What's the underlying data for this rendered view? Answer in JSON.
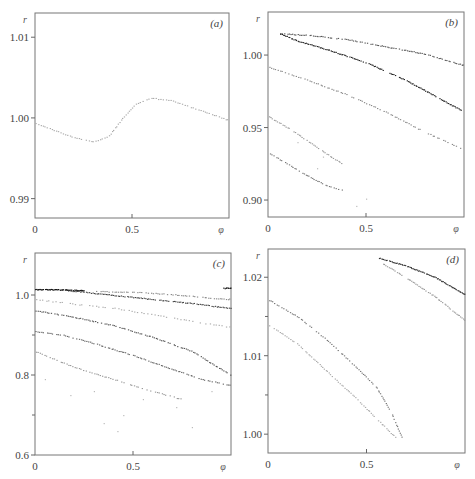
{
  "chart_data": [
    {
      "type": "scatter",
      "panel_label": "(a)",
      "xlabel": "φ",
      "ylabel": "r",
      "xlim": [
        0,
        1.0
      ],
      "ylim": [
        0.9876,
        1.013
      ],
      "xticks": [
        {
          "v": 0,
          "label": "0"
        },
        {
          "v": 0.5,
          "label": "0.5"
        }
      ],
      "yticks": [
        {
          "v": 1.01,
          "label": "1.01"
        },
        {
          "v": 1.0,
          "label": "1.00"
        },
        {
          "v": 0.99,
          "label": "0.99"
        }
      ],
      "yminor": [],
      "grid": false,
      "series": [
        {
          "name": "orbit-1",
          "shade": "#aaaaaa",
          "density": 90,
          "points": [
            [
              0.0,
              0.9994
            ],
            [
              0.1,
              0.9985
            ],
            [
              0.2,
              0.9976
            ],
            [
              0.3,
              0.9971
            ],
            [
              0.38,
              0.9978
            ],
            [
              0.45,
              1.0
            ],
            [
              0.52,
              1.0018
            ],
            [
              0.6,
              1.0025
            ],
            [
              0.7,
              1.0022
            ],
            [
              0.8,
              1.0014
            ],
            [
              0.9,
              1.0006
            ],
            [
              1.0,
              0.9997
            ]
          ]
        }
      ]
    },
    {
      "type": "scatter",
      "panel_label": "(b)",
      "xlabel": "φ",
      "ylabel": "r",
      "xlim": [
        0,
        1.0
      ],
      "ylim": [
        0.8883,
        1.0297
      ],
      "xticks": [
        {
          "v": 0,
          "label": "0"
        },
        {
          "v": 0.5,
          "label": "0.5"
        }
      ],
      "yticks": [
        {
          "v": 1.0,
          "label": "1.00"
        },
        {
          "v": 0.95,
          "label": "0.95"
        },
        {
          "v": 0.9,
          "label": "0.90"
        }
      ],
      "yminor": [],
      "grid": false,
      "series": [
        {
          "name": "upper-branch",
          "shade": "#555555",
          "density": 110,
          "points": [
            [
              0.06,
              1.015
            ],
            [
              0.2,
              1.014
            ],
            [
              0.4,
              1.011
            ],
            [
              0.6,
              1.006
            ],
            [
              0.8,
              1.001
            ],
            [
              1.0,
              0.993
            ]
          ]
        },
        {
          "name": "lower-branch",
          "shade": "#222222",
          "density": 140,
          "points": [
            [
              0.06,
              1.015
            ],
            [
              0.15,
              1.01
            ],
            [
              0.3,
              1.004
            ],
            [
              0.5,
              0.995
            ],
            [
              0.7,
              0.983
            ],
            [
              0.85,
              0.972
            ],
            [
              1.0,
              0.961
            ]
          ]
        },
        {
          "name": "middle-band",
          "shade": "#888888",
          "density": 90,
          "points": [
            [
              0.0,
              0.992
            ],
            [
              0.2,
              0.983
            ],
            [
              0.4,
              0.973
            ],
            [
              0.6,
              0.961
            ],
            [
              0.8,
              0.947
            ],
            [
              1.0,
              0.935
            ]
          ]
        },
        {
          "name": "low-band-1",
          "shade": "#999999",
          "density": 45,
          "points": [
            [
              0.0,
              0.958
            ],
            [
              0.1,
              0.95
            ],
            [
              0.2,
              0.941
            ],
            [
              0.3,
              0.932
            ],
            [
              0.38,
              0.925
            ]
          ]
        },
        {
          "name": "low-band-2",
          "shade": "#777777",
          "density": 45,
          "points": [
            [
              0.0,
              0.933
            ],
            [
              0.1,
              0.925
            ],
            [
              0.2,
              0.917
            ],
            [
              0.3,
              0.91
            ],
            [
              0.38,
              0.907
            ]
          ]
        },
        {
          "name": "scattered",
          "shade": "#bbbbbb",
          "density": 12,
          "points": [
            [
              0.15,
              0.94
            ],
            [
              0.25,
              0.922
            ],
            [
              0.45,
              0.896
            ],
            [
              0.5,
              0.901
            ],
            [
              0.28,
              0.93
            ]
          ]
        }
      ]
    },
    {
      "type": "scatter",
      "panel_label": "(c)",
      "xlabel": "φ",
      "ylabel": "r",
      "xlim": [
        0,
        1.0
      ],
      "ylim": [
        0.6,
        1.105
      ],
      "xticks": [
        {
          "v": 0,
          "label": "0"
        },
        {
          "v": 0.5,
          "label": "0.5"
        }
      ],
      "yticks": [
        {
          "v": 1.0,
          "label": "1.0"
        },
        {
          "v": 0.8,
          "label": "0.8"
        },
        {
          "v": 0.6,
          "label": "0.6"
        }
      ],
      "yminor": [
        0.9,
        0.7
      ],
      "grid": false,
      "series": [
        {
          "name": "top-solid",
          "shade": "#111111",
          "density": 60,
          "points": [
            [
              0.0,
              1.015
            ],
            [
              0.15,
              1.014
            ],
            [
              0.25,
              1.012
            ]
          ]
        },
        {
          "name": "top-right-solid",
          "shade": "#111111",
          "density": 8,
          "points": [
            [
              0.96,
              1.018
            ],
            [
              1.0,
              1.018
            ]
          ]
        },
        {
          "name": "band-1",
          "shade": "#444444",
          "density": 110,
          "points": [
            [
              0.15,
              1.013
            ],
            [
              0.4,
              1.0
            ],
            [
              0.6,
              0.99
            ],
            [
              0.8,
              0.98
            ],
            [
              1.0,
              0.967
            ]
          ]
        },
        {
          "name": "band-1b",
          "shade": "#888888",
          "density": 70,
          "points": [
            [
              0.3,
              1.01
            ],
            [
              0.5,
              1.008
            ],
            [
              0.7,
              1.002
            ],
            [
              0.9,
              0.993
            ],
            [
              1.0,
              0.99
            ]
          ]
        },
        {
          "name": "band-2",
          "shade": "#aaaaaa",
          "density": 60,
          "points": [
            [
              0.0,
              0.99
            ],
            [
              0.2,
              0.978
            ],
            [
              0.4,
              0.968
            ],
            [
              0.6,
              0.952
            ],
            [
              0.8,
              0.935
            ],
            [
              1.0,
              0.92
            ]
          ]
        },
        {
          "name": "band-3",
          "shade": "#555555",
          "density": 110,
          "points": [
            [
              0.0,
              0.962
            ],
            [
              0.2,
              0.945
            ],
            [
              0.4,
              0.925
            ],
            [
              0.6,
              0.895
            ],
            [
              0.8,
              0.86
            ],
            [
              1.0,
              0.8
            ]
          ]
        },
        {
          "name": "band-4",
          "shade": "#666666",
          "density": 110,
          "points": [
            [
              0.0,
              0.91
            ],
            [
              0.15,
              0.9
            ],
            [
              0.3,
              0.88
            ],
            [
              0.5,
              0.85
            ],
            [
              0.7,
              0.815
            ],
            [
              0.85,
              0.79
            ],
            [
              1.0,
              0.775
            ]
          ]
        },
        {
          "name": "band-5",
          "shade": "#999999",
          "density": 70,
          "points": [
            [
              0.0,
              0.86
            ],
            [
              0.2,
              0.82
            ],
            [
              0.4,
              0.79
            ],
            [
              0.6,
              0.76
            ],
            [
              0.75,
              0.74
            ]
          ]
        },
        {
          "name": "scattered",
          "shade": "#bbbbbb",
          "density": 16,
          "points": [
            [
              0.05,
              0.79
            ],
            [
              0.18,
              0.75
            ],
            [
              0.3,
              0.76
            ],
            [
              0.45,
              0.7
            ],
            [
              0.55,
              0.74
            ],
            [
              0.35,
              0.68
            ],
            [
              0.72,
              0.72
            ],
            [
              0.8,
              0.67
            ],
            [
              0.42,
              0.66
            ],
            [
              0.9,
              0.76
            ]
          ]
        }
      ]
    },
    {
      "type": "scatter",
      "panel_label": "(d)",
      "xlabel": "φ",
      "ylabel": "r",
      "xlim": [
        0,
        1.0
      ],
      "ylim": [
        0.9976,
        1.0236
      ],
      "xticks": [
        {
          "v": 0,
          "label": "0"
        },
        {
          "v": 0.5,
          "label": "0.5"
        }
      ],
      "yticks": [
        {
          "v": 1.02,
          "label": "1.02"
        },
        {
          "v": 1.01,
          "label": "1.01"
        },
        {
          "v": 1.0,
          "label": "1.00"
        }
      ],
      "yminor": [
        1.015,
        1.005
      ],
      "grid": false,
      "series": [
        {
          "name": "upper-right-dark",
          "shade": "#333333",
          "density": 80,
          "points": [
            [
              0.56,
              1.0225
            ],
            [
              0.7,
              1.0215
            ],
            [
              0.85,
              1.02
            ],
            [
              1.0,
              1.0178
            ]
          ]
        },
        {
          "name": "upper-right-light",
          "shade": "#999999",
          "density": 60,
          "points": [
            [
              0.58,
              1.0218
            ],
            [
              0.7,
              1.02
            ],
            [
              0.85,
              1.0175
            ],
            [
              1.0,
              1.0145
            ]
          ]
        },
        {
          "name": "left-upper",
          "shade": "#777777",
          "density": 90,
          "points": [
            [
              0.0,
              1.0172
            ],
            [
              0.15,
              1.015
            ],
            [
              0.3,
              1.012
            ],
            [
              0.45,
              1.0085
            ],
            [
              0.55,
              1.006
            ],
            [
              0.62,
              1.003
            ],
            [
              0.68,
              0.9995
            ]
          ]
        },
        {
          "name": "left-lower",
          "shade": "#aaaaaa",
          "density": 80,
          "points": [
            [
              0.0,
              1.014
            ],
            [
              0.15,
              1.0115
            ],
            [
              0.3,
              1.008
            ],
            [
              0.45,
              1.0045
            ],
            [
              0.55,
              1.002
            ],
            [
              0.65,
              0.9995
            ]
          ]
        }
      ]
    }
  ]
}
